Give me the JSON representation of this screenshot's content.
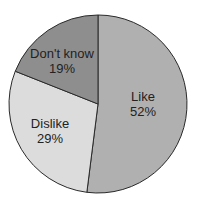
{
  "chart_data": {
    "type": "pie",
    "title": "",
    "categories": [
      "Like",
      "Dislike",
      "Don't know"
    ],
    "values": [
      52,
      29,
      19
    ],
    "unit": "%",
    "start_angle": "top (12 o'clock)",
    "direction": "clockwise",
    "colors": [
      "#b0b0b0",
      "#dcdcdc",
      "#8e8e8e"
    ],
    "legend": "none (labels inside slices)",
    "slices": [
      {
        "label": "Like",
        "value_text": "52%"
      },
      {
        "label": "Dislike",
        "value_text": "29%"
      },
      {
        "label": "Don't know",
        "value_text": "19%"
      }
    ]
  },
  "style": {
    "edge_color": "#2a2a2a",
    "text_color": "#222222"
  }
}
